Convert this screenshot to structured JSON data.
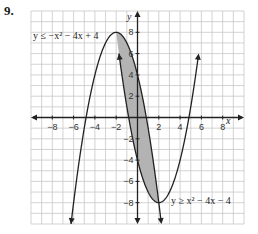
{
  "problem_number": "9.",
  "graph": {
    "x_axis_label": "x",
    "y_axis_label": "y",
    "x_ticks": [
      "−8",
      "−6",
      "−4",
      "−2",
      "2",
      "4",
      "6",
      "8"
    ],
    "y_ticks": [
      "8",
      "6",
      "4",
      "2",
      "−2",
      "−4",
      "−6",
      "−8"
    ],
    "inequality_1": "y ≤ −x² − 4x + 4",
    "inequality_2": "y ≥ x² − 4x − 4",
    "shade_color": "#b3b3b3",
    "grid_color": "#c8c8c8",
    "curve_color": "#222222"
  },
  "chart_data": {
    "type": "line",
    "title": "",
    "xlabel": "x",
    "ylabel": "y",
    "xlim": [
      -10,
      10
    ],
    "ylim": [
      -10,
      10
    ],
    "grid": true,
    "series": [
      {
        "name": "y ≤ −x² − 4x + 4",
        "equation": "y = -x^2 - 4x + 4",
        "vertex": [
          -2,
          8
        ],
        "boundary": "solid"
      },
      {
        "name": "y ≥ x² − 4x − 4",
        "equation": "y = x^2 - 4x - 4",
        "vertex": [
          2,
          -8
        ],
        "boundary": "solid"
      }
    ],
    "shaded_region": {
      "description": "intersection between parabolas",
      "x_range": [
        -2,
        2
      ],
      "intersections": [
        [
          -2,
          8
        ],
        [
          2,
          -8
        ]
      ]
    }
  }
}
